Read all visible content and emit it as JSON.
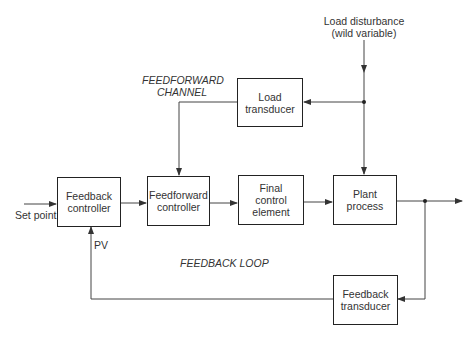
{
  "blocks": {
    "feedback_controller": "Feedback\ncontroller",
    "feedforward_controller": "Feedforward\ncontroller",
    "final_control_element": "Final\ncontrol\nelement",
    "plant_process": "Plant\nprocess",
    "load_transducer": "Load\ntransducer",
    "feedback_transducer": "Feedback\ntransducer"
  },
  "labels": {
    "load_disturbance": "Load disturbance\n(wild variable)",
    "feedforward_channel": "FEEDFORWARD\nCHANNEL",
    "feedback_loop": "FEEDBACK LOOP",
    "set_point": "Set point",
    "pv": "PV"
  },
  "colors": {
    "line": "#333333",
    "box_border": "#222222",
    "text": "#333333"
  }
}
